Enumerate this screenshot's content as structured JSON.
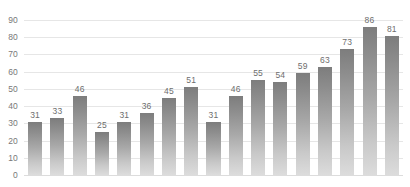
{
  "chart_data": {
    "type": "bar",
    "title": "",
    "subtitle": "",
    "xlabel": "",
    "ylabel": "",
    "categories": [
      "1",
      "2",
      "3",
      "4",
      "5",
      "6",
      "7",
      "8",
      "9",
      "10",
      "11",
      "12",
      "13",
      "14",
      "15",
      "16",
      "17"
    ],
    "values": [
      31,
      33,
      46,
      25,
      31,
      36,
      45,
      51,
      31,
      46,
      55,
      54,
      59,
      63,
      73,
      86,
      81
    ],
    "series": [
      {
        "name": "",
        "values": [
          31,
          33,
          46,
          25,
          31,
          36,
          45,
          51,
          31,
          46,
          55,
          54,
          59,
          63,
          73,
          86,
          81
        ]
      }
    ],
    "data_labels": [
      "31",
      "33",
      "46",
      "25",
      "31",
      "36",
      "45",
      "51",
      "31",
      "46",
      "55",
      "54",
      "59",
      "63",
      "73",
      "86",
      "81"
    ],
    "ylim": [
      0,
      90
    ],
    "ytick_labels": [
      "90",
      "80",
      "70",
      "60",
      "50",
      "40",
      "30",
      "20",
      "10",
      "0"
    ],
    "ytick_values": [
      90,
      80,
      70,
      60,
      50,
      40,
      30,
      20,
      10,
      0
    ],
    "xtick_labels": [],
    "grid": true,
    "grid_axis": "y",
    "legend": false,
    "legend_position": "none",
    "colors": {
      "bar_top": "#7d7d7d",
      "bar_bottom": "#dcdcdc",
      "gridline": "#e6e6e6",
      "baseline": "#dcdcdc",
      "tick_label": "#787878",
      "data_label": "#6e6e6e",
      "background": "#ffffff"
    }
  }
}
